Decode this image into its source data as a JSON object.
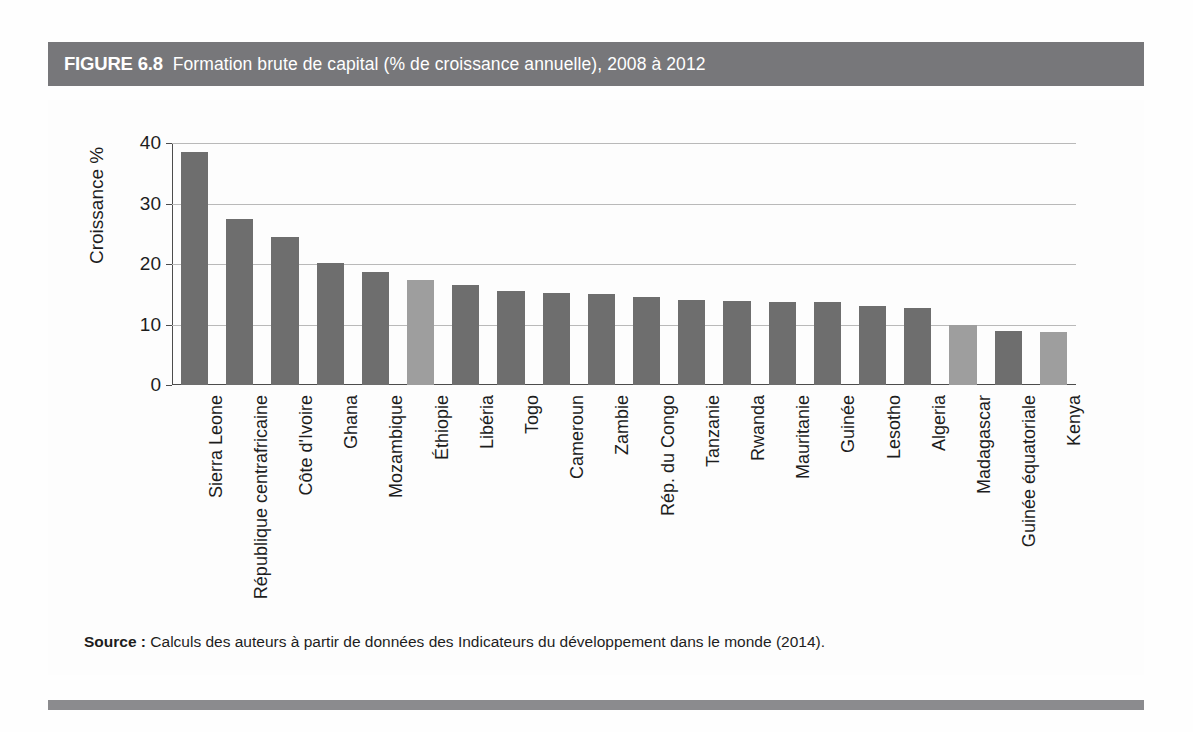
{
  "figure": {
    "number_label": "FIGURE 6.8",
    "title": "Formation brute de capital (% de croissance annuelle), 2008 à 2012",
    "source_label": "Source :",
    "source_text": "Calculs des auteurs à partir de données des Indicateurs du développement dans le monde (2014)."
  },
  "colors": {
    "title_band": "#77777a",
    "bottom_rule": "#8b8b8e",
    "bar_dark": "#6e6e6e",
    "bar_light": "#9e9e9e",
    "axis": "#4c4c4c",
    "gridline": "#b9b9b9",
    "text": "#1d1d1d",
    "title_text": "#ffffff"
  },
  "chart_data": {
    "type": "bar",
    "title": "Formation brute de capital (% de croissance annuelle), 2008 à 2012",
    "xlabel": "",
    "ylabel": "Croissance %",
    "ylim": [
      0,
      40
    ],
    "yticks": [
      0,
      10,
      20,
      30,
      40
    ],
    "ytick_labels": [
      "0",
      "10",
      "20",
      "30",
      "40"
    ],
    "grid": true,
    "legend": false,
    "categories": [
      "Sierra Leone",
      "République centrafricaine",
      "Côte d'Ivoire",
      "Ghana",
      "Mozambique",
      "Éthiopie",
      "Libéria",
      "Togo",
      "Cameroun",
      "Zambie",
      "Rép. du Congo",
      "Tanzanie",
      "Rwanda",
      "Mauritanie",
      "Guinée",
      "Lesotho",
      "Algeria",
      "Madagascar",
      "Guinée équatoriale",
      "Kenya"
    ],
    "values": [
      38.5,
      27.4,
      24.5,
      20.1,
      18.7,
      17.4,
      16.6,
      15.6,
      15.2,
      15.1,
      14.6,
      14.0,
      13.9,
      13.7,
      13.7,
      13.1,
      12.7,
      9.9,
      9.0,
      8.8
    ],
    "bar_shades": [
      "dark",
      "dark",
      "dark",
      "dark",
      "dark",
      "light",
      "dark",
      "dark",
      "dark",
      "dark",
      "dark",
      "dark",
      "dark",
      "dark",
      "dark",
      "dark",
      "dark",
      "light",
      "dark",
      "light"
    ]
  }
}
